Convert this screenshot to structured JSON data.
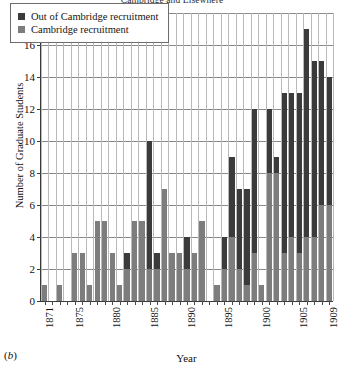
{
  "figure": {
    "title": "Cambridge and Elsewhere",
    "panel_tag": "(b)"
  },
  "legend": {
    "position": "top-left",
    "items": [
      {
        "label": "Out of Cambridge recruitment",
        "color": "#3b3b3b",
        "key": "out"
      },
      {
        "label": "Cambridge recruitment",
        "color": "#7d7d7d",
        "key": "cambridge"
      }
    ]
  },
  "axes": {
    "x": {
      "label": "Year",
      "ticks": [
        "1871",
        "1875",
        "1880",
        "1885",
        "1890",
        "1895",
        "1900",
        "1905",
        "1909"
      ]
    },
    "y": {
      "label": "Number of Graduate Students",
      "ticks": [
        "0",
        "2",
        "4",
        "6",
        "8",
        "10",
        "12",
        "14",
        "16",
        "18"
      ],
      "min": 0,
      "max": 18
    }
  },
  "chart_data": {
    "type": "bar",
    "stacked": true,
    "title": "Cambridge and Elsewhere",
    "xlabel": "Year",
    "ylabel": "Number of Graduate Students",
    "ylim": [
      0,
      18
    ],
    "ytick_step": 2,
    "grid": true,
    "legend_position": "top-left",
    "categories": [
      "1871",
      "1872",
      "1873",
      "1874",
      "1875",
      "1876",
      "1877",
      "1878",
      "1879",
      "1880",
      "1881",
      "1882",
      "1883",
      "1884",
      "1885",
      "1886",
      "1887",
      "1888",
      "1889",
      "1890",
      "1891",
      "1892",
      "1893",
      "1894",
      "1895",
      "1896",
      "1897",
      "1898",
      "1899",
      "1900",
      "1901",
      "1902",
      "1903",
      "1904",
      "1905",
      "1906",
      "1907",
      "1908",
      "1909"
    ],
    "series": [
      {
        "name": "Cambridge recruitment",
        "color": "#7d7d7d",
        "values": [
          1,
          0,
          1,
          0,
          3,
          3,
          1,
          5,
          5,
          3,
          1,
          2,
          5,
          5,
          2,
          2,
          7,
          3,
          3,
          2,
          3,
          5,
          0,
          1,
          2,
          4,
          2,
          1,
          3,
          1,
          8,
          8,
          3,
          4,
          3,
          4,
          4,
          6,
          6
        ]
      },
      {
        "name": "Out of Cambridge recruitment",
        "color": "#3b3b3b",
        "values": [
          0,
          0,
          0,
          0,
          0,
          0,
          0,
          0,
          0,
          0,
          0,
          1,
          0,
          0,
          8,
          1,
          0,
          0,
          0,
          2,
          0,
          0,
          0,
          0,
          2,
          5,
          5,
          6,
          9,
          0,
          4,
          1,
          10,
          9,
          10,
          13,
          11,
          9,
          8
        ]
      }
    ],
    "totals": [
      1,
      0,
      1,
      0,
      3,
      3,
      1,
      5,
      5,
      3,
      1,
      3,
      5,
      5,
      10,
      3,
      7,
      3,
      3,
      4,
      3,
      5,
      0,
      1,
      4,
      9,
      7,
      7,
      12,
      1,
      12,
      9,
      13,
      13,
      13,
      17,
      15,
      15,
      14
    ]
  }
}
